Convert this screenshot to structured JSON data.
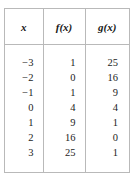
{
  "figure": {
    "kind": "function-value-table",
    "border_color": "#b9b9b9",
    "background_color": "#ffffff",
    "text_color": "#1a1a1a"
  },
  "chart_data": {
    "type": "table",
    "title": "",
    "columns": [
      "x",
      "f(x)",
      "g(x)"
    ],
    "rows": [
      [
        "−3",
        "1",
        "25"
      ],
      [
        "−2",
        "0",
        "16"
      ],
      [
        "−1",
        "1",
        "9"
      ],
      [
        "0",
        "4",
        "4"
      ],
      [
        "1",
        "9",
        "1"
      ],
      [
        "2",
        "16",
        "0"
      ],
      [
        "3",
        "25",
        "1"
      ]
    ],
    "x": [
      -3,
      -2,
      -1,
      0,
      1,
      2,
      3
    ],
    "series": [
      {
        "name": "f(x)",
        "values": [
          1,
          0,
          1,
          4,
          9,
          16,
          25
        ]
      },
      {
        "name": "g(x)",
        "values": [
          25,
          16,
          9,
          4,
          1,
          0,
          1
        ]
      }
    ],
    "xlabel": "x",
    "ylabel": "",
    "grid": true,
    "legend": "none"
  }
}
